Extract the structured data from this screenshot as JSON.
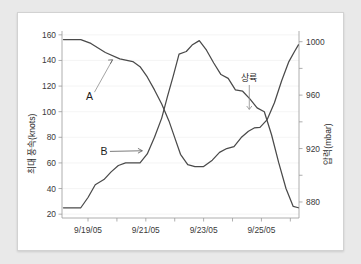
{
  "chart_data": {
    "type": "line",
    "title": "",
    "xlabel": "",
    "ylabel": "최대 풍속(knots)",
    "y2label": "압력(mbar)",
    "grid": true,
    "legend_position": "inline-annotation",
    "x_tick_labels": [
      "9/19/05",
      "9/21/05",
      "9/23/05",
      "9/25/05"
    ],
    "x_tick_values": [
      19,
      21,
      23,
      25
    ],
    "xlim": [
      18.1,
      26.3
    ],
    "y_tick_labels": [
      "20",
      "40",
      "60",
      "80",
      "100",
      "120",
      "140",
      "160"
    ],
    "y_tick_values": [
      20,
      40,
      60,
      80,
      100,
      120,
      140,
      160
    ],
    "ylim": [
      17,
      163
    ],
    "y2_tick_labels": [
      "880",
      "920",
      "960",
      "1000"
    ],
    "y2_tick_values": [
      880,
      920,
      960,
      1000
    ],
    "y2lim": [
      868,
      1008
    ],
    "series": [
      {
        "name": "A",
        "label": "A",
        "axis": "right",
        "unit": "mbar",
        "description": "중심 기압 (pressure)",
        "x": [
          18.15,
          18.75,
          19.1,
          19.6,
          20.1,
          20.55,
          20.8,
          21.05,
          21.3,
          21.55,
          21.8,
          22.0,
          22.2,
          22.45,
          22.7,
          23.0,
          23.3,
          23.55,
          23.8,
          24.05,
          24.3,
          24.55,
          24.75,
          24.95,
          25.2,
          25.45,
          25.7,
          25.95,
          26.15,
          26.28
        ],
        "y_left_equiv": [
          142,
          142,
          139,
          132,
          127,
          125,
          121,
          113,
          103,
          92,
          79,
          66,
          53,
          45,
          43.5,
          43.5,
          48,
          54,
          57,
          58.5,
          66,
          71,
          73.5,
          74,
          80,
          93,
          110,
          125,
          133,
          138
        ],
        "y": [
          1001.6,
          1001.6,
          998.7,
          991.9,
          987.1,
          985.1,
          981.3,
          973.6,
          963.9,
          953.3,
          940.7,
          928.2,
          915.7,
          908.0,
          906.5,
          906.5,
          911.3,
          917.1,
          920.0,
          921.5,
          928.2,
          933.0,
          935.4,
          935.9,
          941.7,
          954.3,
          970.7,
          985.1,
          992.8,
          997.6
        ]
      },
      {
        "name": "B",
        "label": "B",
        "axis": "left",
        "unit": "knots",
        "description": "최대 풍속 (max wind speed)",
        "x": [
          18.15,
          18.75,
          19.0,
          19.25,
          19.55,
          19.8,
          20.05,
          20.3,
          20.55,
          20.8,
          21.05,
          21.3,
          21.55,
          21.75,
          21.95,
          22.15,
          22.4,
          22.6,
          22.85,
          23.1,
          23.35,
          23.6,
          23.85,
          24.1,
          24.35,
          24.6,
          24.85,
          25.1,
          25.35,
          25.6,
          25.85,
          26.1,
          26.28
        ],
        "y": [
          25,
          25,
          33,
          43,
          47,
          53,
          58,
          60,
          60,
          60,
          67,
          80,
          95,
          112,
          128,
          145,
          147,
          152,
          155.5,
          148,
          138,
          129,
          126,
          117,
          116,
          110,
          103,
          100,
          82,
          60,
          40,
          26,
          25
        ]
      }
    ],
    "annotations": [
      {
        "name": "landfall",
        "text": "상륙",
        "x": 24.58,
        "y_left_equiv": 101,
        "pointer": "vertical-line-down"
      },
      {
        "name": "series-a-label",
        "text": "A",
        "x": 19.05,
        "y_left_equiv": 109,
        "pointer": "diagonal-up-right"
      },
      {
        "name": "series-b-label",
        "text": "B",
        "x": 19.55,
        "y_left_equiv": 69,
        "pointer": "horizontal-right-arrow"
      }
    ]
  },
  "colors": {
    "page_background": "#e9e9e9",
    "card_background": "#ffffff",
    "curve": "#4a4a4a",
    "axis": "#9a9a9a",
    "grid": "#f0f0f0",
    "text": "#2b2b2b"
  }
}
